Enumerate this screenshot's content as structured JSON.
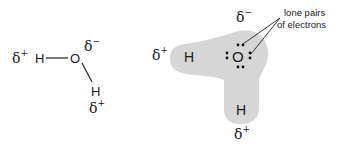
{
  "left_diagram": {
    "labels": {
      "h_left": "H",
      "o": "O",
      "h_bottom": "H",
      "delta": "δ",
      "plus": "+",
      "minus": "−"
    }
  },
  "right_diagram": {
    "labels": {
      "h_left": "H",
      "o": "O",
      "h_bottom": "H",
      "delta": "δ",
      "plus": "+",
      "minus": "−"
    },
    "annotation": {
      "line1": "lone pairs",
      "line2": "of electrons"
    },
    "colors": {
      "cloud": "#d6d6d6",
      "text": "#1a1a1a"
    }
  }
}
